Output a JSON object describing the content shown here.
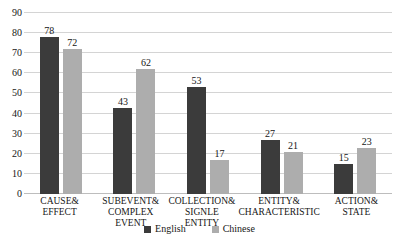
{
  "chart_data": {
    "type": "bar",
    "title": "",
    "subtitle": "",
    "xlabel": "",
    "ylabel": "",
    "ylim": [
      0,
      90
    ],
    "y_ticks": [
      0,
      10,
      20,
      30,
      40,
      50,
      60,
      70,
      80,
      90
    ],
    "grid": true,
    "legend_position": "bottom",
    "categories": [
      "CAUSE& EFFECT",
      "SUBEVENT& COMPLEX EVENT",
      "COLLECTION& SIGNLE ENTITY",
      "ENTITY& CHARACTERISTIC",
      "ACTION& STATE"
    ],
    "category_lines": [
      [
        "CAUSE&",
        "EFFECT"
      ],
      [
        "SUBEVENT&",
        "COMPLEX EVENT"
      ],
      [
        "COLLECTION&",
        "SIGNLE ENTITY"
      ],
      [
        "ENTITY&",
        "CHARACTERISTIC"
      ],
      [
        "ACTION&",
        "STATE"
      ]
    ],
    "series": [
      {
        "name": "English",
        "color": "#3b3b3b",
        "values": [
          78,
          43,
          53,
          27,
          15
        ]
      },
      {
        "name": "Chinese",
        "color": "#adadad",
        "values": [
          72,
          62,
          17,
          21,
          23
        ]
      }
    ]
  },
  "legend": {
    "items": [
      {
        "label": "English",
        "color": "#3b3b3b"
      },
      {
        "label": "Chinese",
        "color": "#adadad"
      }
    ]
  },
  "colors": {
    "english": "#3b3b3b",
    "chinese": "#adadad",
    "gridline": "#d4d4d4",
    "baseline": "#bdbdbd",
    "text": "#161616",
    "background": "#ffffff"
  }
}
